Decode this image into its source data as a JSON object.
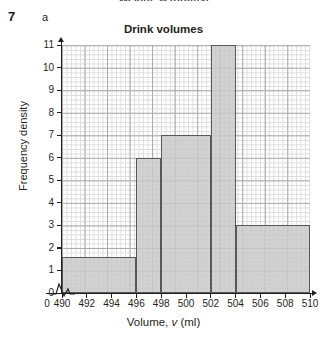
{
  "page": {
    "clipped_previous_caption": "Weight, w (grams)",
    "question_number": "7",
    "question_part": "a"
  },
  "chart_data": {
    "type": "bar",
    "title": "Drink volumes",
    "xlabel_prefix": "Volume, ",
    "xlabel_variable": "v",
    "xlabel_suffix": " (ml)",
    "xlabel": "Volume, v (ml)",
    "ylabel": "Frequency density",
    "grid": true,
    "legend": "none",
    "xlim": [
      490,
      510
    ],
    "ylim": [
      0,
      11
    ],
    "x_axis_break": true,
    "x_break_from": 0,
    "x_break_to": 490,
    "xticks": [
      490,
      492,
      494,
      496,
      498,
      500,
      502,
      504,
      506,
      508,
      510
    ],
    "xtick_labels": [
      "490",
      "492",
      "494",
      "496",
      "498",
      "500",
      "502",
      "504",
      "506",
      "508",
      "510"
    ],
    "origin_tick_label": "0",
    "yticks": [
      0,
      1,
      2,
      3,
      4,
      5,
      6,
      7,
      8,
      9,
      10,
      11
    ],
    "ytick_labels": [
      "0",
      "1",
      "2",
      "3",
      "4",
      "5",
      "6",
      "7",
      "8",
      "9",
      "10",
      "11"
    ],
    "bar_fill_color": "#c8c8c8",
    "bar_edge_color": "#58585a",
    "bars": [
      {
        "start": 490,
        "end": 496,
        "height": 1.6,
        "width": 6,
        "frequency": 9.6
      },
      {
        "start": 496,
        "end": 498,
        "height": 6,
        "width": 2,
        "frequency": 12
      },
      {
        "start": 498,
        "end": 502,
        "height": 7,
        "width": 4,
        "frequency": 28
      },
      {
        "start": 502,
        "end": 504,
        "height": 11,
        "width": 2,
        "frequency": 22
      },
      {
        "start": 504,
        "end": 510,
        "height": 3,
        "width": 6,
        "frequency": 18
      }
    ]
  }
}
